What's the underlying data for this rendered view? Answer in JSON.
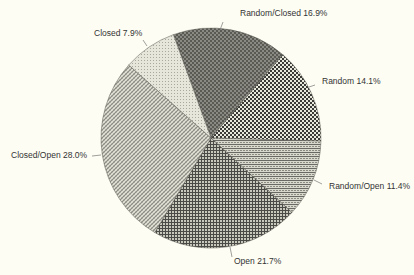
{
  "chart_data": {
    "type": "pie",
    "title": "",
    "start_angle_deg": -20,
    "direction": "clockwise",
    "slices": [
      {
        "label": "Random/Closed",
        "value": 16.9,
        "display": "Random/Closed 16.9%",
        "pattern": "dense-dark-check"
      },
      {
        "label": "Random",
        "value": 14.1,
        "display": "Random 14.1%",
        "pattern": "check"
      },
      {
        "label": "Random/Open",
        "value": 11.4,
        "display": "Random/Open 11.4%",
        "pattern": "horizontal-brick"
      },
      {
        "label": "Open",
        "value": 21.7,
        "display": "Open 21.7%",
        "pattern": "grid"
      },
      {
        "label": "Closed/Open",
        "value": 28.0,
        "display": "Closed/Open  28.0%",
        "pattern": "diagonal-weave"
      },
      {
        "label": "Closed",
        "value": 7.9,
        "display": "Closed 7.9%",
        "pattern": "light-fine"
      }
    ],
    "legend": "none (labels with leader lines)"
  },
  "labels": {
    "random_closed": "Random/Closed 16.9%",
    "random": "Random 14.1%",
    "random_open": "Random/Open 11.4%",
    "open": "Open 21.7%",
    "closed_open": "Closed/Open  28.0%",
    "closed": "Closed 7.9%"
  }
}
